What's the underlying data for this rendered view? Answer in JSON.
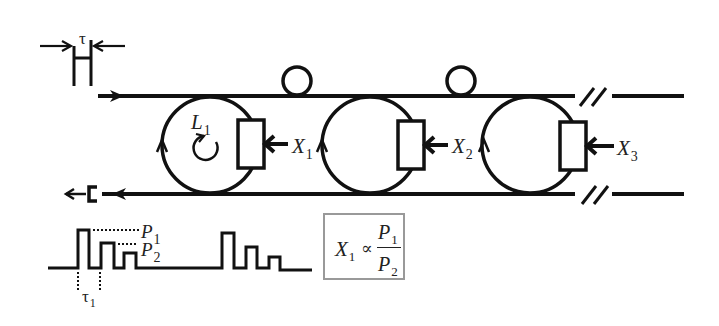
{
  "diagram": {
    "type": "cascaded-ring-resonator-sensor-schematic",
    "input_pulse": {
      "width_label": "τ"
    },
    "rings": [
      {
        "id": "ring-1",
        "loop_label": "L",
        "loop_sub": "1",
        "measurand_label": "X",
        "measurand_sub": "1"
      },
      {
        "id": "ring-2",
        "measurand_label": "X",
        "measurand_sub": "2"
      },
      {
        "id": "ring-3",
        "measurand_label": "X",
        "measurand_sub": "3"
      }
    ],
    "output_trace": {
      "peak_labels": [
        {
          "label": "P",
          "sub": "1"
        },
        {
          "label": "P",
          "sub": "2"
        }
      ],
      "delay_label": "τ",
      "delay_sub": "1"
    },
    "formula": {
      "lhs": "X",
      "lhs_sub": "1",
      "operator": "∝",
      "num": "P",
      "num_sub": "1",
      "den": "P",
      "den_sub": "2"
    },
    "colors": {
      "line": "#111111",
      "formula_border": "#999999",
      "background": "#ffffff"
    }
  }
}
